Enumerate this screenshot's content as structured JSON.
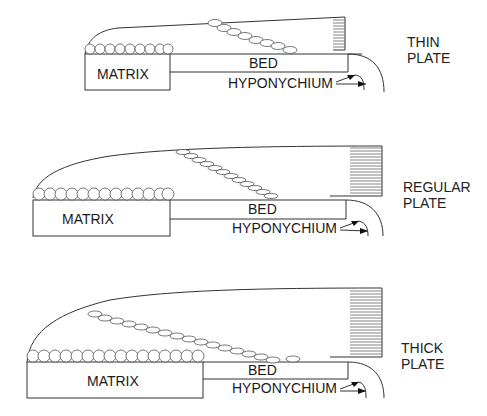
{
  "diagrams": [
    {
      "id": "thin",
      "matrix_label": "MATRIX",
      "bed_label": "BED",
      "hyponychium_label": "HYPONYCHIUM",
      "plate_label_line1": "THIN",
      "plate_label_line2": "PLATE"
    },
    {
      "id": "regular",
      "matrix_label": "MATRIX",
      "bed_label": "BED",
      "hyponychium_label": "HYPONYCHIUM",
      "plate_label_line1": "REGULAR",
      "plate_label_line2": "PLATE"
    },
    {
      "id": "thick",
      "matrix_label": "MATRIX",
      "bed_label": "BED",
      "hyponychium_label": "HYPONYCHIUM",
      "plate_label_line1": "THICK",
      "plate_label_line2": "PLATE"
    }
  ],
  "colors": {
    "line": "#333333",
    "text": "#1a1a1a",
    "background": "#ffffff"
  }
}
